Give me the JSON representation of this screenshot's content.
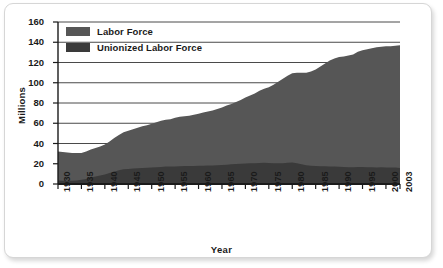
{
  "chart_data": {
    "type": "area",
    "title": "",
    "xlabel": "Year",
    "ylabel": "Millions",
    "ylim": [
      0,
      160
    ],
    "ytick_values": [
      160,
      140,
      120,
      100,
      80,
      60,
      40,
      20,
      0
    ],
    "xtick_labels": [
      "1930",
      "1935",
      "1940",
      "1945",
      "1950",
      "1955",
      "1960",
      "1965",
      "1970",
      "1975",
      "1980",
      "1985",
      "1990",
      "1995",
      "2000",
      "2003"
    ],
    "grid": true,
    "legend_position": "top-left",
    "stacked": false,
    "colors": {
      "labor_force": "#565656",
      "unionized_labor_force": "#3a3a3a",
      "grid": "#4a4a4a",
      "axis": "#1a1a1a",
      "frame_border": "#d6d6d6",
      "background": "#ffffff"
    },
    "x": [
      1930,
      1931,
      1932,
      1933,
      1934,
      1935,
      1936,
      1937,
      1938,
      1939,
      1940,
      1941,
      1942,
      1943,
      1944,
      1945,
      1946,
      1947,
      1948,
      1949,
      1950,
      1951,
      1952,
      1953,
      1954,
      1955,
      1956,
      1957,
      1958,
      1959,
      1960,
      1961,
      1962,
      1963,
      1964,
      1965,
      1966,
      1967,
      1968,
      1969,
      1970,
      1971,
      1972,
      1973,
      1974,
      1975,
      1976,
      1977,
      1978,
      1979,
      1980,
      1981,
      1982,
      1983,
      1984,
      1985,
      1986,
      1987,
      1988,
      1989,
      1990,
      1991,
      1992,
      1993,
      1994,
      1995,
      1996,
      1997,
      1998,
      1999,
      2000,
      2001,
      2002,
      2003
    ],
    "series": [
      {
        "name": "Labor Force",
        "values": [
          32,
          31.5,
          31,
          30.5,
          30.5,
          30.5,
          32,
          34,
          35.5,
          37,
          39,
          42,
          45.5,
          48.5,
          51,
          52.5,
          54,
          55.5,
          57,
          58,
          59.5,
          61,
          62.5,
          63.5,
          64,
          65.5,
          66.5,
          67,
          67.5,
          68.5,
          69.5,
          70.5,
          71.5,
          72.5,
          74,
          75.5,
          77.5,
          79,
          81,
          83,
          85.5,
          87.5,
          89.5,
          92,
          94,
          95.5,
          98,
          101,
          104,
          107,
          109.5,
          110,
          110,
          110,
          111,
          113,
          116,
          119,
          122,
          124,
          125.5,
          126,
          127,
          128,
          130.5,
          132,
          133,
          134,
          135,
          135.5,
          136,
          136,
          136.5,
          137
        ]
      },
      {
        "name": "Unionized Labor Force",
        "values": [
          3.4,
          3.3,
          3.2,
          3.1,
          3.5,
          4.2,
          5,
          6.5,
          7.5,
          8.4,
          9.4,
          10.8,
          12,
          13.5,
          14.5,
          14.8,
          15.2,
          15.6,
          15.8,
          16,
          16.2,
          16.5,
          16.8,
          17.2,
          17.3,
          17.4,
          17.6,
          17.8,
          17.7,
          17.8,
          18,
          18,
          18.2,
          18.3,
          18.5,
          18.8,
          19,
          19.4,
          19.8,
          20,
          20.2,
          20.5,
          20.6,
          20.8,
          21,
          20.8,
          20.6,
          20.5,
          20.6,
          21,
          21.2,
          20.6,
          19.5,
          18.5,
          18,
          17.8,
          17.6,
          17.5,
          17.4,
          17.2,
          17,
          16.8,
          16.6,
          16.6,
          16.7,
          16.8,
          16.6,
          16.5,
          16.4,
          16.5,
          16.4,
          16.3,
          16.2,
          15.8
        ]
      }
    ]
  },
  "legend": {
    "items": [
      {
        "label": "Labor Force",
        "color": "#565656"
      },
      {
        "label": "Unionized Labor Force",
        "color": "#3a3a3a"
      }
    ]
  }
}
